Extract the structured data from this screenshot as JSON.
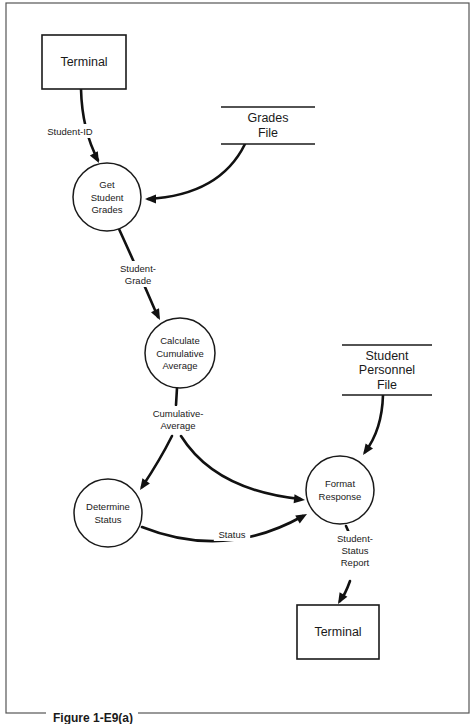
{
  "figure": {
    "caption": "Figure 1-E9(a)",
    "frame": {
      "x": 6,
      "y": 3,
      "width": 463,
      "height": 710
    }
  },
  "colors": {
    "ink": "#111111",
    "background": "#ffffff",
    "frame": "#555555"
  },
  "external_entities": [
    {
      "id": "terminal-in",
      "label": "Terminal",
      "x": 42,
      "y": 35,
      "width": 84,
      "height": 54
    },
    {
      "id": "terminal-out",
      "label": "Terminal",
      "x": 297,
      "y": 605,
      "width": 82,
      "height": 54
    }
  ],
  "processes": [
    {
      "id": "get-student-grades",
      "lines": [
        "Get",
        "Student",
        "Grades"
      ],
      "cx": 107,
      "cy": 197,
      "r": 34
    },
    {
      "id": "calculate-cumulative-average",
      "lines": [
        "Calculate",
        "Cumulative",
        "Average"
      ],
      "cx": 180,
      "cy": 353,
      "r": 35
    },
    {
      "id": "determine-status",
      "lines": [
        "Determine",
        "Status"
      ],
      "cx": 108,
      "cy": 513,
      "r": 34
    },
    {
      "id": "format-response",
      "lines": [
        "Format",
        "Response"
      ],
      "cx": 340,
      "cy": 490,
      "r": 34
    }
  ],
  "data_stores": [
    {
      "id": "grades-file",
      "lines": [
        "Grades",
        "File"
      ],
      "x1": 221,
      "x2": 315,
      "top": 107,
      "bottom": 144
    },
    {
      "id": "student-personnel-file",
      "lines": [
        "Student",
        "Personnel",
        "File"
      ],
      "x1": 342,
      "x2": 432,
      "top": 345,
      "bottom": 395
    }
  ],
  "data_flows": [
    {
      "id": "student-id",
      "from": "terminal-in",
      "to": "get-student-grades",
      "lines": [
        "Student-ID"
      ],
      "path": "M 81 89 Q 82 130 98 160",
      "arrow": {
        "x": 99,
        "y": 163,
        "angle": 62
      },
      "label": {
        "x": 70,
        "y": 131
      }
    },
    {
      "id": "grades-file-read",
      "from": "grades-file",
      "to": "get-student-grades",
      "lines": [],
      "path": "M 245 144 Q 220 195 148 199",
      "arrow": {
        "x": 145,
        "y": 199,
        "angle": 180
      },
      "label": null
    },
    {
      "id": "student-grade",
      "from": "get-student-grades",
      "to": "calculate-cumulative-average",
      "lines": [
        "Student-",
        "Grade"
      ],
      "path": "M 119 229 Q 140 275 158 317",
      "arrow": {
        "x": 160,
        "y": 320,
        "angle": 63
      },
      "label": {
        "x": 138,
        "y": 274
      }
    },
    {
      "id": "cumulative-average-to-status",
      "from": "calculate-cumulative-average",
      "to": "determine-status",
      "lines": [
        "Cumulative-",
        "Average"
      ],
      "path": "M 177 388 L 176 405 M 172 436 Q 160 460 142 487",
      "arrow": {
        "x": 140,
        "y": 490,
        "angle": 124
      },
      "label": {
        "x": 178,
        "y": 419
      }
    },
    {
      "id": "cumulative-average-to-format",
      "from": "calculate-cumulative-average",
      "to": "format-response",
      "lines": [],
      "path": "M 181 436 Q 215 490 300 499",
      "arrow": {
        "x": 305,
        "y": 500,
        "angle": 6
      },
      "label": null
    },
    {
      "id": "status",
      "from": "determine-status",
      "to": "format-response",
      "lines": [
        "Status"
      ],
      "path": "M 142 527 Q 225 560 303 516",
      "arrow": {
        "x": 307,
        "y": 514,
        "angle": -30
      },
      "label": {
        "x": 232,
        "y": 534
      }
    },
    {
      "id": "personnel-file-read",
      "from": "student-personnel-file",
      "to": "format-response",
      "lines": [],
      "path": "M 383 395 Q 382 430 365 452",
      "arrow": {
        "x": 363,
        "y": 455,
        "angle": 125
      },
      "label": null
    },
    {
      "id": "student-status-report",
      "from": "format-response",
      "to": "terminal-out",
      "lines": [
        "Student-",
        "Status",
        "Report"
      ],
      "path": "M 346 526 L 350 535 M 350 581 Q 345 595 340 601",
      "arrow": {
        "x": 338,
        "y": 604,
        "angle": 120
      },
      "label": {
        "x": 355,
        "y": 550
      }
    }
  ]
}
